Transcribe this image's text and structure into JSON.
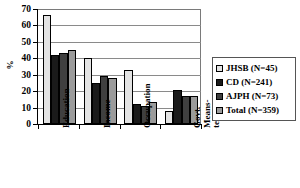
{
  "chart_data": {
    "type": "bar",
    "title": "",
    "xlabel": "",
    "ylabel": "%",
    "ylim": [
      0,
      70
    ],
    "yticks": [
      0,
      10,
      20,
      30,
      40,
      50,
      60,
      70
    ],
    "ytick_labels": [
      "0",
      "10",
      "20",
      "30",
      "40",
      "50",
      "60",
      "70"
    ],
    "grid": true,
    "grid_axis": "y",
    "legend_position": "right",
    "categories": [
      "Education",
      "Income",
      "Occupation",
      "Govt. Means-tested"
    ],
    "category_label_lines": [
      [
        "Education"
      ],
      [
        "Income"
      ],
      [
        "Occupation"
      ],
      [
        "Govt.",
        "Means-",
        "tested"
      ]
    ],
    "series": [
      {
        "name": "JHSB (N=45)",
        "color": "#e3e3e3",
        "values": [
          66.5,
          40.0,
          33.0,
          8.0
        ]
      },
      {
        "name": "CD (N=241)",
        "color": "#1a1a1a",
        "values": [
          42.0,
          25.0,
          12.0,
          20.5
        ]
      },
      {
        "name": "AJPH (N=73)",
        "color": "#3f3f3f",
        "values": [
          43.5,
          29.0,
          11.0,
          17.0
        ]
      },
      {
        "name": "Total (N=359)",
        "color": "#9b9b9b",
        "values": [
          45.0,
          28.0,
          13.5,
          17.0
        ]
      }
    ]
  },
  "legend": {
    "items": [
      {
        "label": "JHSB (N=45)"
      },
      {
        "label": "CD (N=241)"
      },
      {
        "label": "AJPH (N=73)"
      },
      {
        "label": "Total (N=359)"
      }
    ]
  }
}
